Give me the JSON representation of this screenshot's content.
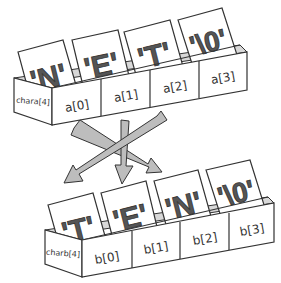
{
  "colors": {
    "outline": "#333333",
    "letter_fill": "#555555",
    "box_face": "#ffffff",
    "box_inner": "#d8d8d8",
    "arrow_fill": "#bdbdbd"
  },
  "array_a": {
    "declaration": "chara[4]",
    "cells": [
      {
        "index_label": "a[0]",
        "card": "'N'"
      },
      {
        "index_label": "a[1]",
        "card": "'E'"
      },
      {
        "index_label": "a[2]",
        "card": "'T'"
      },
      {
        "index_label": "a[3]",
        "card": "'\\0'"
      }
    ]
  },
  "array_b": {
    "declaration": "charb[4]",
    "cells": [
      {
        "index_label": "b[0]",
        "card": "'T'"
      },
      {
        "index_label": "b[1]",
        "card": "'E'"
      },
      {
        "index_label": "b[2]",
        "card": "'N'"
      },
      {
        "index_label": "b[3]",
        "card": "'\\0'"
      }
    ]
  },
  "arrows": [
    {
      "from": "a[0]",
      "to": "b[2]"
    },
    {
      "from": "a[1]",
      "to": "b[1]"
    },
    {
      "from": "a[2]",
      "to": "b[0]"
    }
  ]
}
